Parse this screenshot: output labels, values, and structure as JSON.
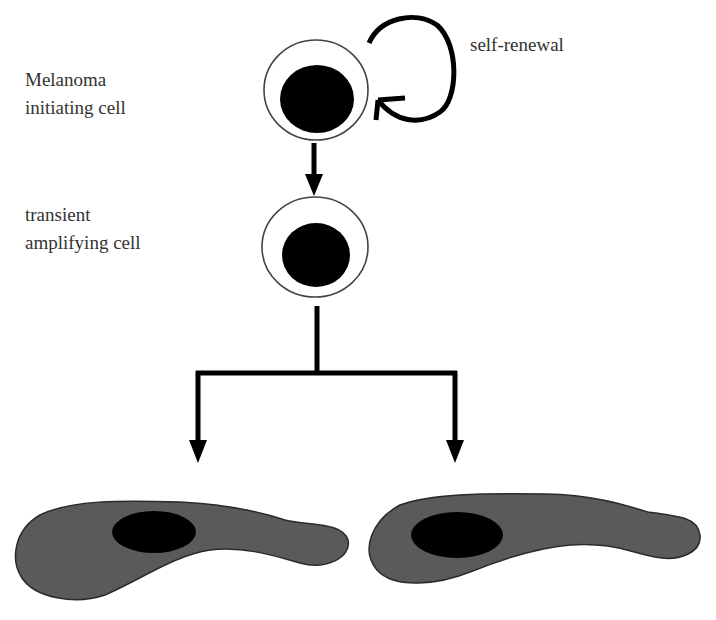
{
  "diagram": {
    "labels": {
      "stem_cell": [
        "Melanoma",
        "initiating cell"
      ],
      "self_renewal": "self-renewal",
      "progenitor": [
        "transient",
        "amplifying cell"
      ]
    },
    "nodes": [
      {
        "id": "melanoma-initiating-cell",
        "type": "round-cell"
      },
      {
        "id": "transient-amplifying-cell",
        "type": "round-cell"
      },
      {
        "id": "differentiated-cell-left",
        "type": "elongated-cell"
      },
      {
        "id": "differentiated-cell-right",
        "type": "elongated-cell"
      }
    ],
    "edges": [
      {
        "from": "melanoma-initiating-cell",
        "to": "melanoma-initiating-cell",
        "label": "self-renewal"
      },
      {
        "from": "melanoma-initiating-cell",
        "to": "transient-amplifying-cell"
      },
      {
        "from": "transient-amplifying-cell",
        "to": "differentiated-cell-left"
      },
      {
        "from": "transient-amplifying-cell",
        "to": "differentiated-cell-right"
      }
    ],
    "colors": {
      "nucleus": "#000000",
      "differentiated_cytoplasm": "#5a5a5a",
      "membrane": "#444444"
    }
  }
}
